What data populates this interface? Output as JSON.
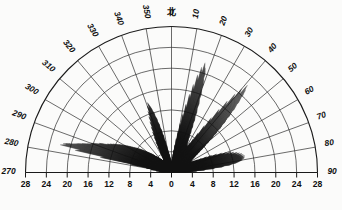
{
  "figure": {
    "kind": "rose-diagram",
    "north_label": "北",
    "bg_color": "#fbfbfa",
    "line_color": "#111111",
    "grid_color": "#2b2b2b"
  },
  "chart_data": {
    "type": "line",
    "subtype": "polar-rose-half",
    "title": "",
    "subtitle": "",
    "xlabel": "",
    "ylabel": "",
    "grid": true,
    "legend": null,
    "orientation": {
      "zero_at": "top",
      "direction": "clockwise",
      "span_degrees": 180,
      "start_degree": 270,
      "end_degree": 90
    },
    "angular_axis": {
      "label": "北",
      "unit": "degrees",
      "tick_step": 10,
      "tick_labels": [
        "270",
        "280",
        "290",
        "300",
        "310",
        "320",
        "330",
        "340",
        "350",
        "0",
        "10",
        "20",
        "30",
        "40",
        "50",
        "60",
        "70",
        "80",
        "90"
      ],
      "tick_values": [
        270,
        280,
        290,
        300,
        310,
        320,
        330,
        340,
        350,
        0,
        10,
        20,
        30,
        40,
        50,
        60,
        70,
        80,
        90
      ]
    },
    "radial_axis": {
      "min": 0,
      "max": 28,
      "tick_step": 4,
      "ring_values": [
        4,
        8,
        12,
        16,
        20,
        24,
        28
      ],
      "baseline_tick_labels": [
        "28",
        "24",
        "20",
        "16",
        "12",
        "8",
        "4",
        "0",
        "4",
        "8",
        "12",
        "16",
        "20",
        "24",
        "28"
      ],
      "baseline_tick_values": [
        -28,
        -24,
        -20,
        -16,
        -12,
        -8,
        -4,
        0,
        4,
        8,
        12,
        16,
        20,
        24,
        28
      ]
    },
    "series": [
      {
        "name": "radial-lines",
        "description": "individual measurement rays drawn from origin",
        "points": [
          {
            "angle": 272,
            "r": 2.0
          },
          {
            "angle": 274,
            "r": 2.4
          },
          {
            "angle": 276,
            "r": 3.0
          },
          {
            "angle": 278,
            "r": 4.0
          },
          {
            "angle": 280,
            "r": 5.0
          },
          {
            "angle": 281,
            "r": 8.0
          },
          {
            "angle": 282,
            "r": 14.0
          },
          {
            "angle": 283,
            "r": 19.0
          },
          {
            "angle": 284,
            "r": 22.0
          },
          {
            "angle": 285,
            "r": 21.5
          },
          {
            "angle": 286,
            "r": 20.0
          },
          {
            "angle": 287,
            "r": 19.0
          },
          {
            "angle": 288,
            "r": 18.0
          },
          {
            "angle": 289,
            "r": 17.0
          },
          {
            "angle": 290,
            "r": 16.5
          },
          {
            "angle": 291,
            "r": 15.5
          },
          {
            "angle": 292,
            "r": 15.0
          },
          {
            "angle": 293,
            "r": 14.0
          },
          {
            "angle": 294,
            "r": 13.5
          },
          {
            "angle": 295,
            "r": 13.0
          },
          {
            "angle": 296,
            "r": 12.5
          },
          {
            "angle": 297,
            "r": 12.0
          },
          {
            "angle": 298,
            "r": 11.5
          },
          {
            "angle": 299,
            "r": 11.0
          },
          {
            "angle": 300,
            "r": 10.5
          },
          {
            "angle": 301,
            "r": 10.0
          },
          {
            "angle": 302,
            "r": 9.5
          },
          {
            "angle": 303,
            "r": 9.0
          },
          {
            "angle": 304,
            "r": 8.6
          },
          {
            "angle": 305,
            "r": 8.2
          },
          {
            "angle": 306,
            "r": 7.8
          },
          {
            "angle": 307,
            "r": 7.4
          },
          {
            "angle": 308,
            "r": 7.0
          },
          {
            "angle": 309,
            "r": 6.6
          },
          {
            "angle": 310,
            "r": 6.2
          },
          {
            "angle": 311,
            "r": 5.9
          },
          {
            "angle": 312,
            "r": 5.6
          },
          {
            "angle": 313,
            "r": 5.3
          },
          {
            "angle": 314,
            "r": 5.0
          },
          {
            "angle": 315,
            "r": 4.7
          },
          {
            "angle": 316,
            "r": 4.4
          },
          {
            "angle": 317,
            "r": 4.2
          },
          {
            "angle": 318,
            "r": 4.0
          },
          {
            "angle": 319,
            "r": 3.8
          },
          {
            "angle": 320,
            "r": 3.6
          },
          {
            "angle": 321,
            "r": 3.4
          },
          {
            "angle": 322,
            "r": 3.2
          },
          {
            "angle": 323,
            "r": 3.1
          },
          {
            "angle": 324,
            "r": 3.0
          },
          {
            "angle": 325,
            "r": 2.9
          },
          {
            "angle": 326,
            "r": 2.8
          },
          {
            "angle": 327,
            "r": 2.8
          },
          {
            "angle": 328,
            "r": 2.9
          },
          {
            "angle": 329,
            "r": 3.2
          },
          {
            "angle": 330,
            "r": 3.8
          },
          {
            "angle": 331,
            "r": 4.6
          },
          {
            "angle": 332,
            "r": 5.6
          },
          {
            "angle": 333,
            "r": 6.6
          },
          {
            "angle": 334,
            "r": 7.6
          },
          {
            "angle": 335,
            "r": 8.6
          },
          {
            "angle": 336,
            "r": 9.6
          },
          {
            "angle": 337,
            "r": 10.6
          },
          {
            "angle": 338,
            "r": 11.6
          },
          {
            "angle": 339,
            "r": 12.6
          },
          {
            "angle": 340,
            "r": 13.6
          },
          {
            "angle": 341,
            "r": 14.2
          },
          {
            "angle": 342,
            "r": 13.4
          },
          {
            "angle": 343,
            "r": 12.4
          },
          {
            "angle": 344,
            "r": 11.2
          },
          {
            "angle": 345,
            "r": 10.0
          },
          {
            "angle": 346,
            "r": 8.8
          },
          {
            "angle": 347,
            "r": 7.6
          },
          {
            "angle": 348,
            "r": 6.4
          },
          {
            "angle": 349,
            "r": 5.4
          },
          {
            "angle": 350,
            "r": 4.6
          },
          {
            "angle": 351,
            "r": 4.0
          },
          {
            "angle": 352,
            "r": 3.6
          },
          {
            "angle": 353,
            "r": 3.2
          },
          {
            "angle": 354,
            "r": 2.9
          },
          {
            "angle": 355,
            "r": 2.6
          },
          {
            "angle": 356,
            "r": 2.4
          },
          {
            "angle": 357,
            "r": 2.2
          },
          {
            "angle": 358,
            "r": 2.1
          },
          {
            "angle": 359,
            "r": 2.0
          },
          {
            "angle": 0,
            "r": 2.0
          },
          {
            "angle": 1,
            "r": 2.1
          },
          {
            "angle": 2,
            "r": 2.3
          },
          {
            "angle": 3,
            "r": 2.6
          },
          {
            "angle": 4,
            "r": 3.0
          },
          {
            "angle": 5,
            "r": 3.6
          },
          {
            "angle": 6,
            "r": 4.4
          },
          {
            "angle": 7,
            "r": 5.4
          },
          {
            "angle": 8,
            "r": 6.6
          },
          {
            "angle": 9,
            "r": 8.0
          },
          {
            "angle": 10,
            "r": 9.6
          },
          {
            "angle": 11,
            "r": 11.4
          },
          {
            "angle": 12,
            "r": 13.4
          },
          {
            "angle": 13,
            "r": 15.4
          },
          {
            "angle": 14,
            "r": 17.4
          },
          {
            "angle": 15,
            "r": 19.4
          },
          {
            "angle": 16,
            "r": 21.0
          },
          {
            "angle": 17,
            "r": 22.0
          },
          {
            "angle": 18,
            "r": 21.0
          },
          {
            "angle": 19,
            "r": 19.0
          },
          {
            "angle": 20,
            "r": 17.0
          },
          {
            "angle": 21,
            "r": 15.0
          },
          {
            "angle": 22,
            "r": 13.2
          },
          {
            "angle": 23,
            "r": 11.6
          },
          {
            "angle": 24,
            "r": 10.2
          },
          {
            "angle": 25,
            "r": 9.0
          },
          {
            "angle": 26,
            "r": 8.0
          },
          {
            "angle": 27,
            "r": 7.2
          },
          {
            "angle": 28,
            "r": 6.6
          },
          {
            "angle": 29,
            "r": 6.2
          },
          {
            "angle": 30,
            "r": 6.0
          },
          {
            "angle": 31,
            "r": 6.2
          },
          {
            "angle": 32,
            "r": 6.8
          },
          {
            "angle": 33,
            "r": 7.8
          },
          {
            "angle": 34,
            "r": 9.2
          },
          {
            "angle": 35,
            "r": 11.0
          },
          {
            "angle": 36,
            "r": 13.0
          },
          {
            "angle": 37,
            "r": 15.2
          },
          {
            "angle": 38,
            "r": 17.4
          },
          {
            "angle": 39,
            "r": 19.4
          },
          {
            "angle": 40,
            "r": 21.0
          },
          {
            "angle": 41,
            "r": 22.2
          },
          {
            "angle": 42,
            "r": 21.2
          },
          {
            "angle": 43,
            "r": 19.6
          },
          {
            "angle": 44,
            "r": 18.0
          },
          {
            "angle": 45,
            "r": 16.4
          },
          {
            "angle": 46,
            "r": 14.8
          },
          {
            "angle": 47,
            "r": 13.4
          },
          {
            "angle": 48,
            "r": 12.0
          },
          {
            "angle": 49,
            "r": 10.8
          },
          {
            "angle": 50,
            "r": 9.6
          },
          {
            "angle": 51,
            "r": 8.6
          },
          {
            "angle": 52,
            "r": 7.8
          },
          {
            "angle": 53,
            "r": 7.0
          },
          {
            "angle": 54,
            "r": 6.4
          },
          {
            "angle": 55,
            "r": 5.8
          },
          {
            "angle": 56,
            "r": 5.4
          },
          {
            "angle": 57,
            "r": 5.0
          },
          {
            "angle": 58,
            "r": 4.7
          },
          {
            "angle": 59,
            "r": 4.5
          },
          {
            "angle": 60,
            "r": 4.4
          },
          {
            "angle": 61,
            "r": 4.4
          },
          {
            "angle": 62,
            "r": 4.6
          },
          {
            "angle": 63,
            "r": 5.0
          },
          {
            "angle": 64,
            "r": 5.6
          },
          {
            "angle": 65,
            "r": 6.4
          },
          {
            "angle": 66,
            "r": 7.4
          },
          {
            "angle": 67,
            "r": 8.4
          },
          {
            "angle": 68,
            "r": 9.4
          },
          {
            "angle": 69,
            "r": 10.4
          },
          {
            "angle": 70,
            "r": 11.2
          },
          {
            "angle": 71,
            "r": 12.0
          },
          {
            "angle": 72,
            "r": 12.6
          },
          {
            "angle": 73,
            "r": 13.2
          },
          {
            "angle": 74,
            "r": 13.6
          },
          {
            "angle": 75,
            "r": 14.0
          },
          {
            "angle": 76,
            "r": 14.2
          },
          {
            "angle": 77,
            "r": 14.4
          },
          {
            "angle": 78,
            "r": 14.4
          },
          {
            "angle": 79,
            "r": 14.2
          },
          {
            "angle": 80,
            "r": 13.8
          },
          {
            "angle": 81,
            "r": 13.0
          },
          {
            "angle": 82,
            "r": 11.8
          },
          {
            "angle": 83,
            "r": 10.2
          },
          {
            "angle": 84,
            "r": 8.4
          },
          {
            "angle": 85,
            "r": 6.6
          },
          {
            "angle": 86,
            "r": 5.0
          },
          {
            "angle": 87,
            "r": 3.8
          },
          {
            "angle": 88,
            "r": 2.8
          },
          {
            "angle": 89,
            "r": 2.2
          }
        ]
      }
    ]
  }
}
